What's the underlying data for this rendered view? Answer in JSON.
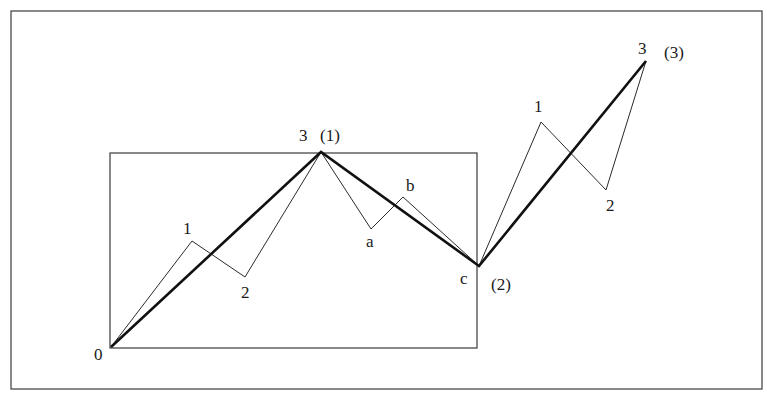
{
  "diagram": {
    "type": "elliott-wave-diagram",
    "colors": {
      "line": "#111111",
      "frame": "#3a3a3a",
      "background": "#ffffff"
    },
    "points": {
      "origin": {
        "label": "0"
      },
      "sub1_wave1": {
        "label": "1"
      },
      "sub1_wave2": {
        "label": "2"
      },
      "major1": {
        "label": "3",
        "degree_label": "(1)"
      },
      "corr_a": {
        "label": "a"
      },
      "corr_b": {
        "label": "b"
      },
      "major2": {
        "label": "c",
        "degree_label": "(2)"
      },
      "sub3_wave1": {
        "label": "1"
      },
      "sub3_wave2": {
        "label": "2"
      },
      "major3": {
        "label": "3",
        "degree_label": "(3)"
      }
    }
  }
}
